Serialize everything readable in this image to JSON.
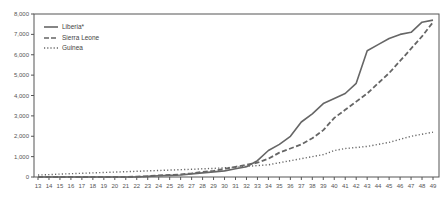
{
  "chart_data": {
    "type": "line",
    "title": "",
    "xlabel": "",
    "ylabel": "",
    "x": [
      13,
      14,
      15,
      16,
      17,
      18,
      19,
      20,
      21,
      22,
      23,
      24,
      25,
      26,
      27,
      28,
      29,
      30,
      31,
      32,
      33,
      34,
      35,
      36,
      37,
      38,
      39,
      40,
      41,
      42,
      43,
      44,
      45,
      46,
      47,
      48,
      49
    ],
    "xlim": [
      13,
      49
    ],
    "ylim": [
      0,
      8000
    ],
    "yticks": [
      0,
      1000,
      2000,
      3000,
      4000,
      5000,
      6000,
      7000,
      8000
    ],
    "ytick_labels": [
      "0",
      "1,000",
      "2,000",
      "3,000",
      "4,000",
      "5,000",
      "6,000",
      "7,000",
      "8,000"
    ],
    "xtick_labels": [
      "13",
      "14",
      "15",
      "16",
      "17",
      "18",
      "19",
      "20",
      "21",
      "22",
      "23",
      "24",
      "25",
      "26",
      "27",
      "28",
      "29",
      "30",
      "31",
      "32",
      "33",
      "34",
      "35",
      "36",
      "37",
      "38",
      "39",
      "40",
      "41",
      "42",
      "43",
      "44",
      "45",
      "46",
      "47",
      "48",
      "49"
    ],
    "grid": false,
    "legend_position": "upper left",
    "series": [
      {
        "name": "Liberia*",
        "style": "solid",
        "values": [
          0,
          0,
          0,
          0,
          0,
          0,
          0,
          0,
          0,
          0,
          30,
          60,
          80,
          100,
          150,
          200,
          250,
          300,
          400,
          500,
          800,
          1300,
          1600,
          2000,
          2700,
          3100,
          3600,
          3850,
          4100,
          4600,
          6200,
          6500,
          6800,
          7000,
          7100,
          7600,
          7700
        ]
      },
      {
        "name": "Sierra Leone",
        "style": "dashed",
        "values": [
          0,
          0,
          0,
          0,
          0,
          0,
          0,
          0,
          0,
          20,
          40,
          80,
          100,
          130,
          180,
          250,
          300,
          400,
          500,
          600,
          700,
          900,
          1200,
          1400,
          1600,
          1900,
          2300,
          2900,
          3300,
          3700,
          4100,
          4600,
          5100,
          5700,
          6300,
          6900,
          7600
        ]
      },
      {
        "name": "Guinea",
        "style": "dotted",
        "values": [
          100,
          120,
          140,
          160,
          180,
          200,
          220,
          240,
          260,
          280,
          300,
          320,
          340,
          360,
          380,
          400,
          420,
          450,
          480,
          520,
          560,
          600,
          700,
          800,
          900,
          1000,
          1100,
          1300,
          1400,
          1450,
          1500,
          1600,
          1700,
          1850,
          2000,
          2100,
          2200
        ]
      }
    ]
  },
  "legend": {
    "items": [
      {
        "label": "Liberia*"
      },
      {
        "label": "Sierra Leone"
      },
      {
        "label": "Guinea"
      }
    ]
  }
}
